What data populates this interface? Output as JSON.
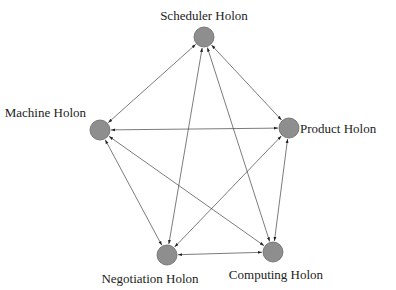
{
  "diagram": {
    "type": "complete-graph",
    "colors": {
      "node_fill": "#8e8e8e",
      "edge": "#444444",
      "text": "#222222",
      "background": "#ffffff"
    },
    "nodes": [
      {
        "id": "scheduler",
        "label": "Scheduler Holon",
        "x": 204,
        "y": 37,
        "lx": 204,
        "ly": 20,
        "anchor": "middle"
      },
      {
        "id": "machine",
        "label": "Machine Holon",
        "x": 100,
        "y": 130,
        "lx": 86,
        "ly": 117,
        "anchor": "end"
      },
      {
        "id": "product",
        "label": "Product Holon",
        "x": 289,
        "y": 128,
        "lx": 300,
        "ly": 133,
        "anchor": "start"
      },
      {
        "id": "negotiation",
        "label": "Negotiation Holon",
        "x": 167,
        "y": 255,
        "lx": 150,
        "ly": 283,
        "anchor": "middle"
      },
      {
        "id": "computing",
        "label": "Computing Holon",
        "x": 273,
        "y": 252,
        "lx": 276,
        "ly": 279,
        "anchor": "middle"
      }
    ],
    "edges": [
      [
        "scheduler",
        "machine"
      ],
      [
        "scheduler",
        "product"
      ],
      [
        "scheduler",
        "negotiation"
      ],
      [
        "scheduler",
        "computing"
      ],
      [
        "machine",
        "product"
      ],
      [
        "machine",
        "negotiation"
      ],
      [
        "machine",
        "computing"
      ],
      [
        "product",
        "negotiation"
      ],
      [
        "product",
        "computing"
      ],
      [
        "negotiation",
        "computing"
      ]
    ],
    "edge_style": "bidirectional-arrows",
    "node_radius": 10
  }
}
